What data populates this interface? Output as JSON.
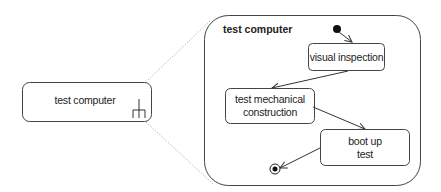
{
  "diagram": {
    "type": "UML state machine",
    "composite_state": {
      "label": "test computer",
      "has_composite_icon": true,
      "icon": "composite-state-rake-icon"
    },
    "expanded_state": {
      "title": "test computer",
      "states": [
        {
          "id": "visual",
          "label": "visual inspection"
        },
        {
          "id": "mech",
          "label_line1": "test mechanical",
          "label_line2": "construction"
        },
        {
          "id": "boot",
          "label_line1": "boot up",
          "label_line2": "test"
        }
      ],
      "transitions": [
        {
          "from": "initial",
          "to": "visual inspection"
        },
        {
          "from": "visual inspection",
          "to": "test mechanical construction"
        },
        {
          "from": "test mechanical construction",
          "to": "boot up test"
        },
        {
          "from": "boot up test",
          "to": "final"
        }
      ]
    },
    "colors": {
      "stroke": "#3a3a3a",
      "dotted": "#999999",
      "background": "#ffffff"
    }
  }
}
